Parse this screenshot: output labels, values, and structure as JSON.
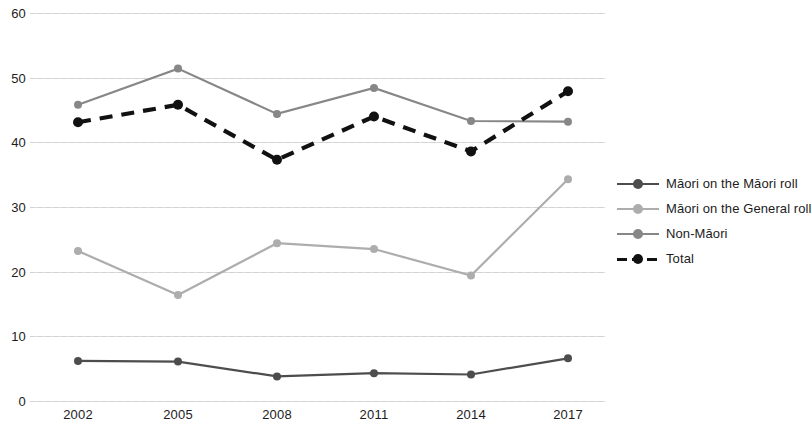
{
  "chart_data": {
    "type": "line",
    "title": "",
    "subtitle": "",
    "xlabel": "",
    "ylabel": "",
    "categories": [
      "2002",
      "2005",
      "2008",
      "2011",
      "2014",
      "2017"
    ],
    "x": [
      2002,
      2005,
      2008,
      2011,
      2014,
      2017
    ],
    "ylim": [
      0,
      60
    ],
    "y_ticks": [
      0,
      10,
      20,
      30,
      40,
      50,
      60
    ],
    "y_tick_labels": [
      "0",
      "10",
      "20",
      "30",
      "40",
      "50",
      "60"
    ],
    "grid": true,
    "grid_axis": "y",
    "legend_position": "right",
    "series": [
      {
        "name": "Māori on the Māori roll",
        "values": [
          6.2,
          6.1,
          3.8,
          4.3,
          4.1,
          6.6
        ],
        "color": "#4d4d4d",
        "style": "solid",
        "marker": "circle"
      },
      {
        "name": "Māori on the General roll",
        "values": [
          23.2,
          16.4,
          24.4,
          23.5,
          19.4,
          34.3
        ],
        "color": "#adadad",
        "style": "solid",
        "marker": "circle"
      },
      {
        "name": "Non-Māori",
        "values": [
          45.8,
          51.4,
          44.4,
          48.4,
          43.3,
          43.2
        ],
        "color": "#878787",
        "style": "solid",
        "marker": "circle"
      },
      {
        "name": "Total",
        "values": [
          43.1,
          45.8,
          37.3,
          44.0,
          38.6,
          47.9
        ],
        "color": "#111111",
        "style": "dashed",
        "marker": "circle"
      }
    ]
  },
  "legend": {
    "items": [
      {
        "label": "Māori on the Māori roll"
      },
      {
        "label": "Māori on the General roll"
      },
      {
        "label": "Non-Māori"
      },
      {
        "label": "Total"
      }
    ]
  }
}
